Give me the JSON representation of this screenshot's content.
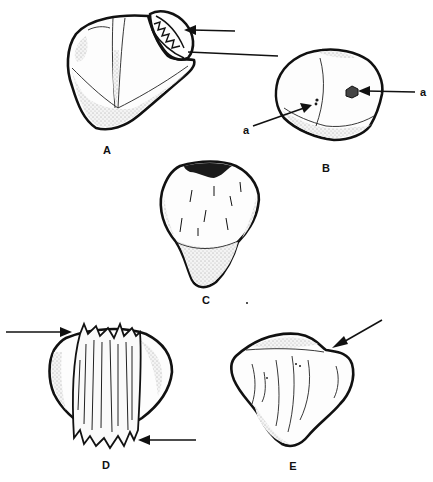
{
  "figure": {
    "panels": [
      {
        "id": "A",
        "label": "A"
      },
      {
        "id": "B",
        "label": "B",
        "annotations": [
          "a",
          "a"
        ]
      },
      {
        "id": "C",
        "label": "C"
      },
      {
        "id": "D",
        "label": "D"
      },
      {
        "id": "E",
        "label": "E"
      }
    ],
    "colors": {
      "ink": "#111111",
      "paper": "#ffffff"
    }
  }
}
